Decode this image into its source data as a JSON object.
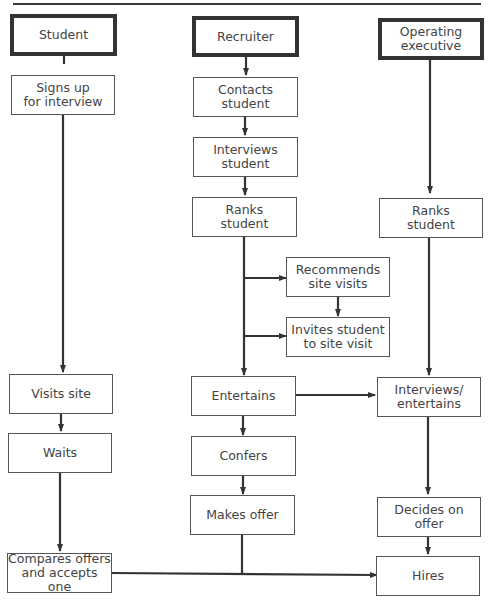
{
  "diagram": {
    "type": "swimlane-flowchart",
    "lanes": [
      {
        "id": "student",
        "label": "Student"
      },
      {
        "id": "recruiter",
        "label": "Recruiter"
      },
      {
        "id": "executive",
        "label": "Operating\nexecutive"
      }
    ],
    "nodes": {
      "signs_up": "Signs up\nfor interview",
      "visits_site": "Visits site",
      "waits": "Waits",
      "compares": "Compares offers\nand accepts one",
      "contacts": "Contacts\nstudent",
      "interviews": "Interviews\nstudent",
      "ranks_r": "Ranks\nstudent",
      "recommends": "Recommends\nsite visits",
      "invites": "Invites student\nto site visit",
      "entertains": "Entertains",
      "confers": "Confers",
      "makes_offer": "Makes offer",
      "ranks_e": "Ranks\nstudent",
      "interviews_ent": "Interviews/\nentertains",
      "decides": "Decides on\noffer",
      "hires": "Hires"
    },
    "edges": [
      [
        "student",
        "signs_up"
      ],
      [
        "signs_up",
        "visits_site"
      ],
      [
        "visits_site",
        "waits"
      ],
      [
        "waits",
        "compares"
      ],
      [
        "recruiter",
        "contacts"
      ],
      [
        "contacts",
        "interviews"
      ],
      [
        "interviews",
        "ranks_r"
      ],
      [
        "ranks_r",
        "recommends"
      ],
      [
        "recommends",
        "invites"
      ],
      [
        "ranks_r",
        "invites"
      ],
      [
        "ranks_r",
        "entertains"
      ],
      [
        "entertains",
        "interviews_ent"
      ],
      [
        "entertains",
        "confers"
      ],
      [
        "confers",
        "makes_offer"
      ],
      [
        "makes_offer",
        "hires"
      ],
      [
        "compares",
        "hires"
      ],
      [
        "executive",
        "ranks_e"
      ],
      [
        "ranks_e",
        "interviews_ent"
      ],
      [
        "interviews_ent",
        "decides"
      ],
      [
        "decides",
        "hires"
      ]
    ]
  }
}
